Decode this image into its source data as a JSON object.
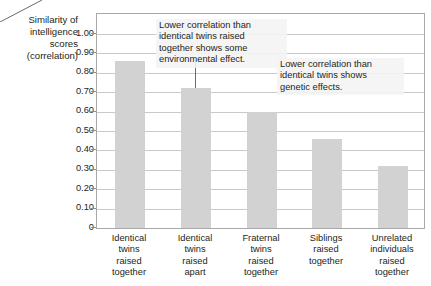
{
  "chart_data": {
    "type": "bar",
    "title": "",
    "subtitle": "",
    "xlabel": "",
    "ylabel": "Similarity of intelligence scores (correlation)",
    "ylabel_lines": [
      "Similarity of",
      "intelligence",
      "scores",
      "(correlation)"
    ],
    "categories": [
      "Identical twins raised together",
      "Identical twins raised apart",
      "Fraternal twins raised together",
      "Siblings raised together",
      "Unrelated individuals raised together"
    ],
    "category_lines": [
      [
        "Identical",
        "twins",
        "raised",
        "together"
      ],
      [
        "Identical",
        "twins",
        "raised",
        "apart"
      ],
      [
        "Fraternal",
        "twins",
        "raised",
        "together"
      ],
      [
        "Siblings",
        "raised",
        "together"
      ],
      [
        "Unrelated",
        "individuals",
        "raised",
        "together"
      ]
    ],
    "values": [
      0.86,
      0.72,
      0.6,
      0.46,
      0.32
    ],
    "ylim": [
      0,
      1.0
    ],
    "ytick_values": [
      0,
      0.1,
      0.2,
      0.3,
      0.4,
      0.5,
      0.6,
      0.7,
      0.8,
      0.9,
      1.0
    ],
    "ytick_labels": [
      "0",
      "0.10",
      "0.20",
      "0.30",
      "0.40",
      "0.50",
      "0.60",
      "0.70",
      "0.80",
      "0.90",
      "1.00"
    ],
    "grid": true,
    "legend": "none",
    "bar_color": "#d2d2d2",
    "gridline_color": "#c9c9c9",
    "frame_color": "#a9a9a9",
    "text_color": "#231f20",
    "annotations": [
      {
        "id": "environmental",
        "text": "Lower correlation than identical twins raised together shows some environmental effect.",
        "lines": [
          "Lower correlation than",
          "identical twins raised",
          "together shows some",
          "environmental effect."
        ],
        "points_to_category": "Identical twins raised apart"
      },
      {
        "id": "genetic",
        "text": "Lower correlation than identical twins shows genetic effects.",
        "lines": [
          "Lower correlation than",
          "identical twins shows",
          "genetic effects."
        ],
        "points_to_category": "Fraternal twins raised together"
      }
    ]
  }
}
